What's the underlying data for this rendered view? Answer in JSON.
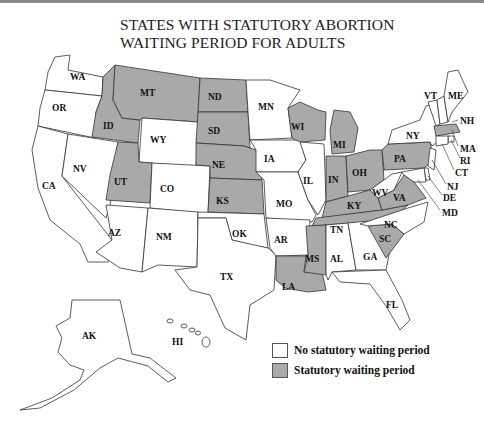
{
  "title": {
    "line1": "STATES WITH STATUTORY ABORTION",
    "line2": "WAITING PERIOD FOR ADULTS"
  },
  "colors": {
    "waiting_period": "#a9a9a9",
    "no_waiting_period": "#ffffff",
    "border": "#333333"
  },
  "legend": {
    "items": [
      {
        "label": "No statutory waiting period",
        "color": "#ffffff"
      },
      {
        "label": "Statutory waiting period",
        "color": "#a9a9a9"
      }
    ]
  },
  "states_with_waiting_period": [
    "MT",
    "ID",
    "ND",
    "SD",
    "NE",
    "KS",
    "UT",
    "WI",
    "MI",
    "IN",
    "OH",
    "KY",
    "PA",
    "WV",
    "VA",
    "TN",
    "MS",
    "LA",
    "SC",
    "MA"
  ],
  "states_without_waiting_period": [
    "WA",
    "OR",
    "CA",
    "NV",
    "AZ",
    "NM",
    "WY",
    "CO",
    "OK",
    "TX",
    "MN",
    "IA",
    "MO",
    "AR",
    "IL",
    "AL",
    "GA",
    "FL",
    "NC",
    "NY",
    "VT",
    "NH",
    "ME",
    "RI",
    "CT",
    "NJ",
    "DE",
    "MD",
    "AK",
    "HI"
  ],
  "labels": {
    "WA": "WA",
    "OR": "OR",
    "CA": "CA",
    "NV": "NV",
    "ID": "ID",
    "MT": "MT",
    "WY": "WY",
    "UT": "UT",
    "CO": "CO",
    "AZ": "AZ",
    "NM": "NM",
    "ND": "ND",
    "SD": "SD",
    "NE": "NE",
    "KS": "KS",
    "OK": "OK",
    "TX": "TX",
    "MN": "MN",
    "IA": "IA",
    "MO": "MO",
    "AR": "AR",
    "LA": "LA",
    "WI": "WI",
    "IL": "IL",
    "MI": "MI",
    "IN": "IN",
    "OH": "OH",
    "KY": "KY",
    "TN": "TN",
    "MS": "MS",
    "AL": "AL",
    "GA": "GA",
    "FL": "FL",
    "SC": "SC",
    "NC": "NC",
    "VA": "VA",
    "WV": "WV",
    "PA": "PA",
    "NY": "NY",
    "VT": "VT",
    "NH": "NH",
    "ME": "ME",
    "MA": "MA",
    "RI": "RI",
    "CT": "CT",
    "NJ": "NJ",
    "DE": "DE",
    "MD": "MD",
    "AK": "AK",
    "HI": "HI"
  }
}
